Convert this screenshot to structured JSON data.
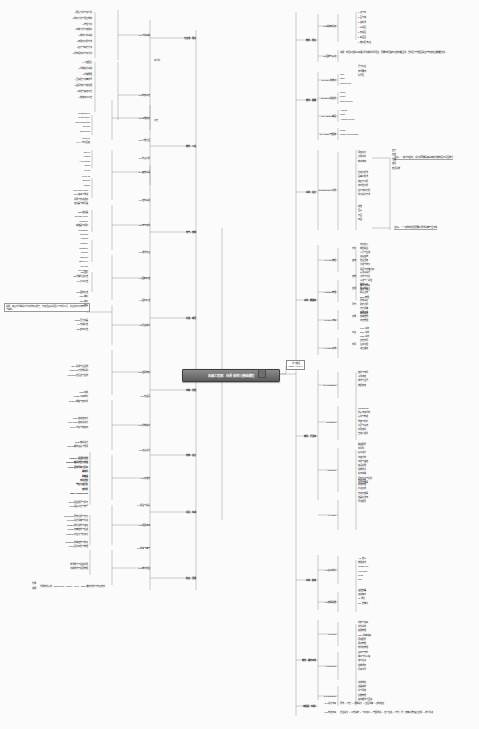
{
  "meta": {
    "title": "机械工程师：体系架构与基础课程",
    "type": "mindmap",
    "background": "#fbfbfb",
    "root_fill": "#6f6f6f",
    "line_color": "#8e8e8e"
  },
  "root": {
    "label": "机械工程师：体系架构与基础课程"
  },
  "root_note": {
    "line1": "学习路径",
    "line2": "MECHANICAL"
  },
  "left_note": {
    "text": "说明：本图为机械设计方向的知识框架，内容涵盖基础理论与软件工具；建议按顺序逐步学习与实践。"
  },
  "annotations": [
    {
      "id": "ann-1",
      "text": "注意1：一般为中级岗，设计师需要具备基本的机械制图与识图能力"
    },
    {
      "id": "ann-2",
      "text": "注意2：一个完整的项目需要从需求到量产全流程"
    }
  ],
  "bottom_note": {
    "label_1": "附录",
    "label_2": "说明",
    "text": "常用软件清单：SolidWorks、UG/NX、Creo、Catia等建模软件与仿真软件"
  },
  "left_branches": [
    {
      "label": "专业课、理论",
      "sub": [
        {
          "label": "1.1 力学基础",
          "leaves": [
            "1 理论力学与静力学",
            "2 材料力学与强度校核",
            "3 弹性力学",
            "4 流体力学与传热学",
            "5 振动力学基础",
            "6 有限元分析方法",
            "7 疲劳与断裂力学",
            "8 机构运动学与动力学"
          ],
          "tag": "静力学"
        },
        {
          "label": "1.2 制造工艺",
          "leaves": [
            "1 公差配合",
            "2 机械设计基础",
            "3 机械原理",
            "4 互换性与测量技术",
            "5 金属材料与热处理",
            "6 铸造与锻造工艺",
            "7 数控加工工艺"
          ],
          "tag": "工艺"
        }
      ]
    },
    {
      "label": "软件、工具",
      "sub": [
        {
          "label": "2.1 三维建模",
          "leaves": [
            "Pro/Engineer",
            "Siemens NX",
            "Creo Parametric",
            "Inventor",
            "SolidWorks"
          ]
        },
        {
          "label": "2.2 二维绘图",
          "leaves": [
            "AutoCAD",
            "CAXA 电子图板"
          ]
        },
        {
          "label": "2.3 仿真分析",
          "leaves": [
            "ANSYS",
            "Abaqus",
            "Hypermesh",
            "Adams",
            "Fluent"
          ],
          "tag_a": "结构",
          "tag_b": "流体"
        },
        {
          "label": "2.4 其他工具",
          "leaves": [
            "MATLAB",
            "Simulink",
            "Python"
          ]
        }
      ]
    },
    {
      "label": "电气、控制",
      "sub": [
        {
          "label": "3.1 控制基础",
          "leaves": [
            "Low Code Logic",
            "PLC 编程与调试",
            "伺服与步进驱动",
            "传感器与执行器"
          ]
        },
        {
          "label": "3.2 电气元件",
          "leaves": [
            "ABB 变频器",
            "Release Relay",
            "Contactor",
            "断路器与保护",
            "MicroEdge",
            "Siemens",
            "Modbus",
            "ringCore"
          ]
        },
        {
          "label": "3.3 通讯协议",
          "leaves": [
            "CanOpen",
            "Profinet",
            "Ethernet",
            "EtherCAT",
            "CC-Link",
            "DeviceNet"
          ]
        }
      ]
    },
    {
      "label": "标准、规范",
      "sub": [
        {
          "label": "4.1 国家标准",
          "leaves": [
            "GB 国标",
            "JB 机械行业标准",
            "HG 化工标准"
          ]
        },
        {
          "label": "4.2 国际标准",
          "leaves": [
            "ISO 国际标准",
            "ANSI 美标",
            "DIN 德标",
            "JIS 日标"
          ]
        },
        {
          "label": "4.3 行业规范",
          "leaves": [
            "ASME 压力容器",
            "API 石油标准",
            "EN 欧洲标准"
          ]
        }
      ]
    },
    {
      "label": "材料、选型",
      "sub": [
        {
          "label": "5.1 金属材料",
          "leaves": [
            "Steel 碳钢与合金钢",
            "Stainless 不锈钢系列",
            "Aluminum 铝合金与型材"
          ]
        },
        {
          "label": "5.2 非金属",
          "leaves": [
            "Cast 铸铁",
            "Plastic 工程塑料",
            "Rubber 橡胶与密封件"
          ]
        }
      ]
    },
    {
      "label": "结构、设计",
      "sub": [
        {
          "label": "6.1 机构设计",
          "leaves": [
            "Ratio 齿轮传动比",
            "Gear Train 齿轮系设计",
            "Pulley 带轮与链传动"
          ]
        },
        {
          "label": "6.2 连接设计",
          "leaves": [
            "Shaft 轴系设计",
            "Thread 螺纹连接与预紧"
          ]
        },
        {
          "label": "6.3 标准件",
          "leaves": [
            "Fastener 紧固件选型",
            "Bearing 轴承选型与校核",
            "Linear 直线导轨与丝杠",
            "减速机",
            "联轴器",
            "电机选型",
            "气缸与液压缸",
            "密封件",
            "Main Components"
          ]
        },
        {
          "label": "6.4 钣金与焊接",
          "leaves": [
            "Sheet 钣金展开与折弯",
            "Weld 焊接工艺与符号"
          ]
        }
      ]
    },
    {
      "label": "项目、实战",
      "sub": [
        {
          "label": "7.1 项目流程",
          "leaves": [
            "Concurrent 需求分析与方案",
            "Review 设计评审与改进",
            "TestDO 样机试制与验证",
            "Quality 质量控制与检验",
            "Platform 平台化与模块化"
          ]
        },
        {
          "label": "7.2 成本与量产",
          "leaves": [
            "CostCont 成本控制与核算",
            "Visual 图纸归档与管理"
          ]
        }
      ]
    },
    {
      "label": "职业、发展",
      "sub": [
        {
          "label": "8.1 能力模型",
          "leaves": [
            "技术能力与经验积累",
            "沟通协作与项目管理"
          ]
        }
      ]
    }
  ],
  "right_branches": [
    {
      "label": "软件、理论",
      "sub": [
        {
          "label": "1.1 基础知识点",
          "leaves": [
            "1 点与线",
            "2 面与体",
            "3 投影法",
            "4 三视图",
            "5 剖视图",
            "6 断面图",
            "7 轴测图与标注"
          ]
        },
        {
          "label": "1.2 图样与表达",
          "note": "说明：制图标准是工程师之间沟通的共同语言，需要掌握国家标准的规定画法；零件图与装配图是生产制造的主要依据文件。",
          "leaves": [
            "尺寸标注",
            "技术要求",
            "标题栏"
          ],
          "tag": "零件图"
        }
      ]
    },
    {
      "label": "软件、建模",
      "sub": [
        {
          "label": "2.1 Creo 参数化",
          "leaves": [
            "Part",
            "Table",
            "Part Review"
          ],
          "tagbox": "草绘模块",
          "tagside": [
            "拉伸与旋转",
            "扫描混合"
          ]
        },
        {
          "label": "2.2 Sheet 钣金件",
          "leaves": [
            "Sheet",
            "Reflex",
            "Sheet Review"
          ],
          "tagbox": "钣金模块",
          "tagside": "In 钣金展开"
        },
        {
          "label": "2.3 Angular 曲面",
          "leaves": [
            "Angular",
            "Profit",
            "Angular Review"
          ],
          "tagbox": "曲面模块",
          "tagside": [
            "边界混合",
            "可变截面扫描",
            "曲面实体化"
          ]
        },
        {
          "label": "2.4 Fusion 装配体",
          "leaves": [
            "Profile",
            "Fusion Specification"
          ],
          "tagbox": "装配模块",
          "tagside": "Longitor 机构运动仿真"
        }
      ]
    },
    {
      "label": "系统、设计",
      "sub": [
        {
          "label": "3.1 Element et 分析",
          "groups": [
            {
              "tag": "基础",
              "leaves": [
                "网格划分",
                "边界条件",
                "载荷施加"
              ],
              "subtag": "结果",
              "subleaves": [
                "应力",
                "应变",
                "位移",
                "变形",
                "安全系数"
              ]
            },
            {
              "tag": "进阶",
              "leaves": [
                "模态分析法",
                "屈曲分析法",
                "热应力分析",
                "非线性分析",
                "疲劳寿命分析",
                "优化设计方法"
              ]
            },
            {
              "tag": "输出",
              "leaves": [
                "报告",
                "图表",
                "云图",
                "动画"
              ]
            }
          ]
        }
      ]
    },
    {
      "label": "系统、数据库",
      "sub": [
        {
          "label": "4.1 Ajax 数据",
          "groups": [
            {
              "tag": "存取",
              "leaves": [
                "字段定义",
                "数据类型",
                "索引与主键"
              ]
            },
            {
              "tag": "查询",
              "leaves": [
                "连接查询",
                "聚合函数",
                "分组与排序",
                "视图与存储过程"
              ]
            }
          ]
        },
        {
          "label": "4.2 Data 管理",
          "groups": [
            {
              "tag": "结构",
              "leaves": [
                "表关系设计",
                "范式与冗余",
                "事务与一致性",
                "备份与恢复",
                "权限与安全"
              ]
            },
            {
              "tag": "应用",
              "leaves": [
                "数据接口",
                "导入导出",
                "报表生成",
                "BOM 管理"
              ]
            }
          ]
        },
        {
          "label": "4.3 Pipe 流程",
          "groups": [
            {
              "tag": "环节",
              "leaves": [
                "需求采集",
                "建模分析",
                "方案评审",
                "样机验证"
              ]
            },
            {
              "tag": "记录",
              "leaves": [
                "变更记录",
                "版本控制",
                "归档管理"
              ]
            }
          ]
        },
        {
          "label": "4.4 Latin 集成",
          "groups": [
            {
              "tag": "平台",
              "leaves": [
                "PLM 系统",
                "ERP 系统",
                "MES 系统"
              ]
            },
            {
              "tag": "协同",
              "leaves": [
                "文档协同",
                "任务分配",
                "进度跟踪"
              ]
            }
          ]
        }
      ]
    },
    {
      "label": "软件、开发库",
      "sub": [
        {
          "label": "5.1 Widgetset",
          "leaves": [
            "控件与布局",
            "事件绑定",
            "样式与主题",
            "数据绑定"
          ]
        },
        {
          "label": "5.2 Richer",
          "leaves": [
            "List Binding",
            "列表渲染机制",
            "表单与校验",
            "弹窗与提示",
            "分页与筛选",
            "树形控件",
            "自定义组件"
          ],
          "tag_a": "视图",
          "tag_b": "交互"
        },
        {
          "label": "5.3 Node",
          "leaves": [
            "路由配置",
            "中间件",
            "接口设计",
            "鉴权机制",
            "日志与监控",
            "错误处理",
            "性能优化",
            "缓存策略",
            "异步任务与队列",
            "测试与部署"
          ],
          "tag_a": "服务",
          "tag_b": "运维"
        },
        {
          "label": "5.4 Pipe",
          "leaves": [
            "构建打包",
            "依赖管理",
            "持续集成",
            "自动化部署",
            "容器化发布",
            "环境配置"
          ],
          "tag_a": "流程"
        }
      ]
    },
    {
      "label": "系统、集成",
      "sub": [
        {
          "label": "6.1 接口规范",
          "leaves": [
            "API 定义",
            "数据格式",
            "JSON/XML",
            "Typescript",
            "Read",
            "Tree"
          ],
          "tagbox": "CSS 与 样式",
          "tagside": "Collected"
        },
        {
          "label": "6.2 部署运维",
          "leaves": [
            "监控告警",
            "容灾备份",
            "IO 调度",
            "Lite 轻量化"
          ],
          "tag": "Data",
          "tagside": [
            "日志分析",
            "性能指标"
          ],
          "rightbox": "DevOps 自动化"
        }
      ]
    },
    {
      "label": "软件、操作系统",
      "sub": [
        {
          "label": "7.1 Linux",
          "leaves": [
            "内核与进程",
            "文件系统",
            "权限管理",
            "Shell 脚本编程",
            "网络配置",
            "服务管理",
            "软件包管理"
          ]
        },
        {
          "label": "7.2 Service",
          "leaves": [
            "启动与守护",
            "端口与防火墙",
            "定时任务",
            "性能调优",
            "远程访问"
          ]
        },
        {
          "label": "7.3 Container",
          "leaves": [
            "镜像构建",
            "容器编排",
            "卷与网络",
            "集群管理",
            "滚动更新与回滚"
          ]
        }
      ]
    },
    {
      "label": "流程图、实例1",
      "sub": [
        {
          "label": "8.1 设计流程",
          "text": "需求 → 方案 → 详细设计 → 出图评审 → 试制验证"
        },
        {
          "label": "8.2 制造流程",
          "text": "模型设计 → 工艺编排 → 下料加工 → 装配调试 → 出厂检验 → 交付；附：质量追溯与售后反馈 → 迭代改进"
        }
      ]
    }
  ]
}
